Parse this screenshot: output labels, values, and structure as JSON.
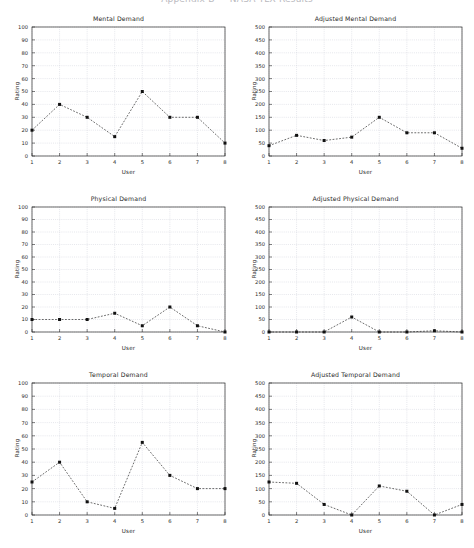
{
  "page": {
    "clipped_header_text": "Appendix  B  —  NASA TLX  Results",
    "background_color": "#ffffff",
    "line_color": "#1c1c1c",
    "grid_color": "#c6c9d4"
  },
  "axis_labels": {
    "x": "User",
    "y": "Rating"
  },
  "charts": [
    {
      "id": "mental-demand",
      "title": "Mental Demand",
      "xticks": [
        "1",
        "2",
        "3",
        "4",
        "5",
        "6",
        "7",
        "8"
      ],
      "yticks": [
        "0",
        "10",
        "20",
        "30",
        "40",
        "50",
        "60",
        "70",
        "80",
        "90",
        "100"
      ]
    },
    {
      "id": "adjusted-mental-demand",
      "title": "Adjusted Mental Demand",
      "xticks": [
        "1",
        "2",
        "3",
        "4",
        "5",
        "6",
        "7",
        "8"
      ],
      "yticks": [
        "0",
        "50",
        "100",
        "150",
        "200",
        "250",
        "300",
        "350",
        "400",
        "450",
        "500"
      ]
    },
    {
      "id": "physical-demand",
      "title": "Physical Demand",
      "xticks": [
        "1",
        "2",
        "3",
        "4",
        "5",
        "6",
        "7",
        "8"
      ],
      "yticks": [
        "0",
        "10",
        "20",
        "30",
        "40",
        "50",
        "60",
        "70",
        "80",
        "90",
        "100"
      ]
    },
    {
      "id": "adjusted-physical-demand",
      "title": "Adjusted Physical Demand",
      "xticks": [
        "1",
        "2",
        "3",
        "4",
        "5",
        "6",
        "7",
        "8"
      ],
      "yticks": [
        "0",
        "50",
        "100",
        "150",
        "200",
        "250",
        "300",
        "350",
        "400",
        "450",
        "500"
      ]
    },
    {
      "id": "temporal-demand",
      "title": "Temporal Demand",
      "xticks": [
        "1",
        "2",
        "3",
        "4",
        "5",
        "6",
        "7",
        "8"
      ],
      "yticks": [
        "0",
        "10",
        "20",
        "30",
        "40",
        "50",
        "60",
        "70",
        "80",
        "90",
        "100"
      ]
    },
    {
      "id": "adjusted-temporal-demand",
      "title": "Adjusted Temporal Demand",
      "xticks": [
        "1",
        "2",
        "3",
        "4",
        "5",
        "6",
        "7",
        "8"
      ],
      "yticks": [
        "0",
        "50",
        "100",
        "150",
        "200",
        "250",
        "300",
        "350",
        "400",
        "450",
        "500"
      ]
    }
  ],
  "chart_data": [
    {
      "type": "line",
      "title": "Mental Demand",
      "xlabel": "User",
      "ylabel": "Rating",
      "x": [
        1,
        2,
        3,
        4,
        5,
        6,
        7,
        8
      ],
      "values": [
        20,
        40,
        30,
        15,
        50,
        30,
        30,
        10
      ],
      "xlim": [
        1,
        8
      ],
      "ylim": [
        0,
        100
      ],
      "ytick_step": 10,
      "grid": true,
      "legend": false,
      "marker": "square",
      "linestyle": "dashed"
    },
    {
      "type": "line",
      "title": "Adjusted Mental Demand",
      "xlabel": "User",
      "ylabel": "Rating",
      "x": [
        1,
        2,
        3,
        4,
        5,
        6,
        7,
        8
      ],
      "values": [
        40,
        80,
        60,
        73,
        150,
        90,
        90,
        30
      ],
      "xlim": [
        1,
        8
      ],
      "ylim": [
        0,
        500
      ],
      "ytick_step": 50,
      "grid": true,
      "legend": false,
      "marker": "square",
      "linestyle": "dashed"
    },
    {
      "type": "line",
      "title": "Physical Demand",
      "xlabel": "User",
      "ylabel": "Rating",
      "x": [
        1,
        2,
        3,
        4,
        5,
        6,
        7,
        8
      ],
      "values": [
        10,
        10,
        10,
        15,
        5,
        20,
        5,
        0
      ],
      "xlim": [
        1,
        8
      ],
      "ylim": [
        0,
        100
      ],
      "ytick_step": 10,
      "grid": true,
      "legend": false,
      "marker": "square",
      "linestyle": "dashed"
    },
    {
      "type": "line",
      "title": "Adjusted Physical Demand",
      "xlabel": "User",
      "ylabel": "Rating",
      "x": [
        1,
        2,
        3,
        4,
        5,
        6,
        7,
        8
      ],
      "values": [
        0,
        0,
        0,
        60,
        0,
        0,
        5,
        0
      ],
      "xlim": [
        1,
        8
      ],
      "ylim": [
        0,
        500
      ],
      "ytick_step": 50,
      "grid": true,
      "legend": false,
      "marker": "square",
      "linestyle": "dashed"
    },
    {
      "type": "line",
      "title": "Temporal Demand",
      "xlabel": "User",
      "ylabel": "Rating",
      "x": [
        1,
        2,
        3,
        4,
        5,
        6,
        7,
        8
      ],
      "values": [
        25,
        40,
        10,
        5,
        55,
        30,
        20,
        20
      ],
      "xlim": [
        1,
        8
      ],
      "ylim": [
        0,
        100
      ],
      "ytick_step": 10,
      "grid": true,
      "legend": false,
      "marker": "square",
      "linestyle": "dashed"
    },
    {
      "type": "line",
      "title": "Adjusted Temporal Demand",
      "xlabel": "User",
      "ylabel": "Rating",
      "x": [
        1,
        2,
        3,
        4,
        5,
        6,
        7,
        8
      ],
      "values": [
        125,
        120,
        40,
        0,
        110,
        90,
        0,
        40
      ],
      "xlim": [
        1,
        8
      ],
      "ylim": [
        0,
        500
      ],
      "ytick_step": 50,
      "grid": true,
      "legend": false,
      "marker": "square",
      "linestyle": "dashed"
    }
  ]
}
